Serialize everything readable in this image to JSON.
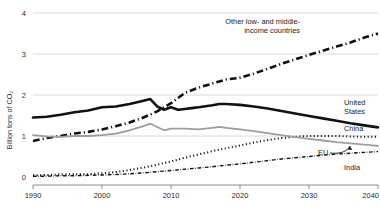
{
  "chart_data": {
    "type": "line",
    "title": "",
    "xlabel": "",
    "ylabel": "Billion tons of CO₂",
    "xlim": [
      1990,
      2040
    ],
    "ylim": [
      0,
      4
    ],
    "xticks": [
      1990,
      2000,
      2010,
      2020,
      2030,
      2040
    ],
    "yticks": [
      0,
      1,
      2,
      3,
      4
    ],
    "grid": "horizontal",
    "legend_position": "inline-annotations",
    "series": [
      {
        "name": "Other low- and middle-income countries",
        "style": "dash-dot",
        "color": "#111111",
        "width": 2.6,
        "x": [
          1990,
          1992,
          1994,
          1996,
          1998,
          2000,
          2002,
          2004,
          2006,
          2008,
          2010,
          2012,
          2014,
          2016,
          2017,
          2018,
          2020,
          2022,
          2024,
          2026,
          2028,
          2030,
          2032,
          2034,
          2036,
          2038,
          2040
        ],
        "y": [
          0.88,
          0.95,
          1.0,
          1.06,
          1.1,
          1.16,
          1.24,
          1.33,
          1.45,
          1.6,
          1.8,
          2.05,
          2.18,
          2.28,
          2.33,
          2.38,
          2.42,
          2.52,
          2.64,
          2.76,
          2.87,
          2.98,
          3.08,
          3.18,
          3.28,
          3.4,
          3.5
        ]
      },
      {
        "name": "United States",
        "style": "solid",
        "color": "#111111",
        "width": 2.6,
        "x": [
          1990,
          1992,
          1994,
          1996,
          1998,
          2000,
          2002,
          2004,
          2006,
          2007,
          2008,
          2009,
          2010,
          2011,
          2012,
          2013,
          2014,
          2016,
          2017,
          2018,
          2020,
          2022,
          2024,
          2026,
          2028,
          2030,
          2032,
          2034,
          2036,
          2038,
          2040
        ],
        "y": [
          1.45,
          1.47,
          1.52,
          1.58,
          1.62,
          1.7,
          1.72,
          1.78,
          1.86,
          1.9,
          1.72,
          1.64,
          1.7,
          1.64,
          1.66,
          1.68,
          1.7,
          1.75,
          1.78,
          1.78,
          1.76,
          1.72,
          1.67,
          1.61,
          1.55,
          1.49,
          1.43,
          1.37,
          1.31,
          1.26,
          1.21
        ]
      },
      {
        "name": "China",
        "style": "dotted",
        "color": "#111111",
        "width": 2.0,
        "x": [
          1990,
          1992,
          1994,
          1996,
          1998,
          2000,
          2002,
          2004,
          2006,
          2008,
          2010,
          2012,
          2014,
          2016,
          2018,
          2020,
          2022,
          2024,
          2026,
          2028,
          2030,
          2032,
          2034,
          2036,
          2038,
          2040
        ],
        "y": [
          0.04,
          0.05,
          0.06,
          0.07,
          0.07,
          0.09,
          0.12,
          0.17,
          0.23,
          0.3,
          0.38,
          0.47,
          0.55,
          0.63,
          0.7,
          0.77,
          0.84,
          0.9,
          0.95,
          0.98,
          1.0,
          1.0,
          1.0,
          0.99,
          0.98,
          0.98
        ]
      },
      {
        "name": "EU",
        "style": "solid",
        "color": "#9d9d9d",
        "width": 1.8,
        "x": [
          1990,
          1992,
          1994,
          1996,
          1998,
          2000,
          2002,
          2004,
          2006,
          2007,
          2008,
          2009,
          2010,
          2012,
          2014,
          2016,
          2017,
          2018,
          2020,
          2022,
          2024,
          2026,
          2028,
          2030,
          2032,
          2034,
          2036,
          2038,
          2040
        ],
        "y": [
          1.02,
          0.99,
          0.98,
          1.0,
          1.0,
          1.02,
          1.06,
          1.14,
          1.24,
          1.3,
          1.22,
          1.14,
          1.18,
          1.18,
          1.16,
          1.2,
          1.22,
          1.2,
          1.16,
          1.12,
          1.07,
          1.02,
          0.97,
          0.93,
          0.89,
          0.85,
          0.82,
          0.79,
          0.76
        ]
      },
      {
        "name": "India",
        "style": "dash-dot",
        "color": "#111111",
        "width": 1.4,
        "x": [
          1990,
          1992,
          1994,
          1996,
          1998,
          2000,
          2002,
          2004,
          2006,
          2008,
          2010,
          2012,
          2014,
          2016,
          2018,
          2020,
          2022,
          2024,
          2026,
          2028,
          2030,
          2032,
          2034,
          2036,
          2038,
          2040
        ],
        "y": [
          0.02,
          0.02,
          0.03,
          0.03,
          0.04,
          0.05,
          0.06,
          0.08,
          0.1,
          0.13,
          0.16,
          0.19,
          0.22,
          0.25,
          0.29,
          0.32,
          0.36,
          0.4,
          0.44,
          0.47,
          0.5,
          0.53,
          0.56,
          0.58,
          0.6,
          0.62
        ]
      }
    ],
    "annotations": [
      {
        "name": "other-countries-label",
        "lines": [
          "Other low- and middle-",
          "income countries"
        ],
        "x": 300,
        "y": 24,
        "anchor": "end"
      },
      {
        "name": "united-states-label",
        "lines": [
          "United",
          "States"
        ],
        "x": 344,
        "y": 105,
        "anchor": "start"
      },
      {
        "name": "china-label",
        "lines": [
          "China"
        ],
        "x": 344,
        "y": 131,
        "anchor": "start"
      },
      {
        "name": "eu-label",
        "lines": [
          "EU"
        ],
        "x": 318,
        "y": 155,
        "anchor": "start"
      },
      {
        "name": "india-label",
        "lines": [
          "India"
        ],
        "x": 344,
        "y": 170,
        "anchor": "start"
      }
    ]
  }
}
